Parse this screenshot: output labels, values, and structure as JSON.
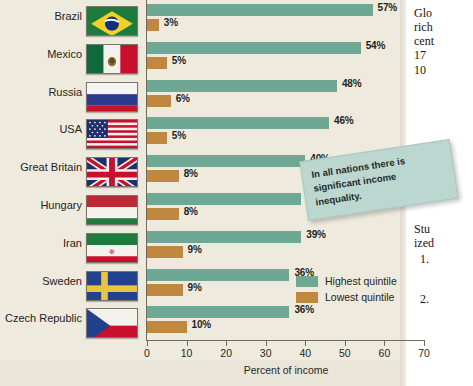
{
  "chart_data": {
    "type": "bar",
    "orientation": "horizontal",
    "title": "",
    "xlabel": "Percent of income",
    "ylabel": "",
    "xlim": [
      0,
      70
    ],
    "xticks": [
      0,
      10,
      20,
      30,
      40,
      50,
      60,
      70
    ],
    "grid": false,
    "legend_position": "inside-bottom-right",
    "categories": [
      "Brazil",
      "Mexico",
      "Russia",
      "USA",
      "Great Britain",
      "Hungary",
      "Iran",
      "Sweden",
      "Czech Republic"
    ],
    "series": [
      {
        "name": "Highest quintile",
        "color": "#6ea894",
        "values": [
          57,
          54,
          48,
          46,
          40,
          39,
          39,
          36,
          36
        ],
        "labels": [
          "57%",
          "54%",
          "48%",
          "46%",
          "40%",
          "39%",
          "39%",
          "36%",
          "36%"
        ]
      },
      {
        "name": "Lowest quintile",
        "color": "#c0873f",
        "values": [
          3,
          5,
          6,
          5,
          8,
          8,
          9,
          9,
          10
        ],
        "labels": [
          "3%",
          "5%",
          "6%",
          "5%",
          "8%",
          "8%",
          "9%",
          "9%",
          "10%"
        ]
      }
    ],
    "annotations": [
      "In all nations there is significant income inequality."
    ]
  },
  "axis": {
    "x_title": "Percent of income",
    "tick_labels": [
      "0",
      "10",
      "20",
      "30",
      "40",
      "50",
      "60",
      "70"
    ]
  },
  "legend": {
    "items": [
      {
        "label": "Highest quintile",
        "color": "#6ea894"
      },
      {
        "label": "Lowest quintile",
        "color": "#c0873f"
      }
    ]
  },
  "callout": {
    "text": "In all nations there is significant income inequality."
  },
  "countries": [
    {
      "name": "Brazil",
      "flag": "flag-brazil"
    },
    {
      "name": "Mexico",
      "flag": "flag-mexico"
    },
    {
      "name": "Russia",
      "flag": "flag-russia"
    },
    {
      "name": "USA",
      "flag": "flag-usa"
    },
    {
      "name": "Great Britain",
      "flag": "flag-great-britain"
    },
    {
      "name": "Hungary",
      "flag": "flag-hungary"
    },
    {
      "name": "Iran",
      "flag": "flag-iran"
    },
    {
      "name": "Sweden",
      "flag": "flag-sweden"
    },
    {
      "name": "Czech Republic",
      "flag": "flag-czech-republic"
    }
  ],
  "side_text": {
    "top_lines": [
      "Glo",
      "rich",
      "cent",
      "17 ",
      "10"
    ],
    "bottom_lines": [
      "Stu",
      "ized"
    ],
    "list_markers": [
      "1.",
      "2."
    ]
  },
  "colors": {
    "highest_quintile": "#6ea894",
    "lowest_quintile": "#c0873f",
    "page_background": "#eeeade",
    "callout_background": "#bcd7cf"
  }
}
